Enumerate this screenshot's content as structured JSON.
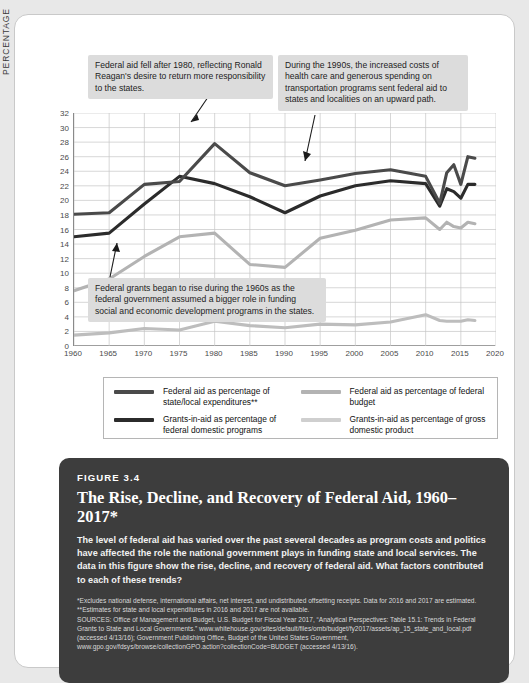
{
  "chart_data": {
    "type": "line",
    "xlabel": "",
    "ylabel": "PERCENTAGE",
    "xlim": [
      1960,
      2020
    ],
    "ylim": [
      0,
      32
    ],
    "ytick_step": 2,
    "yticks": [
      32,
      30,
      28,
      26,
      24,
      22,
      20,
      18,
      16,
      14,
      12,
      10,
      8,
      6,
      4,
      2,
      0
    ],
    "xticks": [
      1960,
      1965,
      1970,
      1975,
      1980,
      1985,
      1990,
      1995,
      2000,
      2005,
      2010,
      2015,
      2020
    ],
    "grid": true,
    "legend_position": "below",
    "x": [
      1960,
      1965,
      1970,
      1975,
      1980,
      1985,
      1990,
      1995,
      2000,
      2005,
      2010,
      2012,
      2013,
      2014,
      2015,
      2016,
      2017
    ],
    "series": [
      {
        "name": "Grants-in-aid as percentage of federal domestic programs",
        "color": "#2b2b2b",
        "values": [
          15.0,
          15.5,
          19.5,
          23.3,
          22.3,
          20.5,
          18.3,
          20.6,
          22.0,
          22.7,
          22.3,
          19.2,
          21.6,
          21.2,
          20.3,
          22.2,
          22.2
        ]
      },
      {
        "name": "Federal aid as percentage of state/local expenditures**",
        "color": "#4a4a4a",
        "values": [
          18.1,
          18.3,
          22.2,
          22.6,
          27.8,
          23.8,
          22.0,
          22.8,
          23.7,
          24.2,
          23.3,
          19.6,
          23.8,
          24.9,
          22.2,
          26.0,
          25.8
        ]
      },
      {
        "name": "Federal aid as percentage of federal budget",
        "color": "#b3b3b3",
        "values": [
          7.6,
          9.2,
          12.3,
          15.0,
          15.5,
          11.2,
          10.8,
          14.8,
          15.9,
          17.3,
          17.6,
          16.0,
          17.0,
          16.4,
          16.2,
          17.0,
          16.8
        ]
      },
      {
        "name": "Grants-in-aid as percentage of gross domestic product",
        "color": "#bdbdbd",
        "values": [
          1.5,
          1.8,
          2.4,
          2.2,
          3.4,
          2.8,
          2.5,
          3.0,
          2.9,
          3.3,
          4.3,
          3.5,
          3.4,
          3.4,
          3.4,
          3.6,
          3.5
        ]
      }
    ],
    "annotations": [
      "Federal aid fell after 1980, reflecting Ronald Reagan's desire to return more responsibility to the states.",
      "During the 1990s, the increased costs of health care and generous spending on transportation programs sent federal aid to states and localities on an upward path.",
      "Federal grants began to rise during the 1960s as the federal government assumed a bigger role in funding social and economic development programs in the states."
    ]
  },
  "callouts": {
    "one": "Federal aid fell after 1980, reflecting Ronald Reagan's desire to return more responsibility to the states.",
    "two": "During the 1990s, the increased costs of health care and generous spending on transportation programs sent federal aid to states and localities on an upward path.",
    "three": "Federal grants began to rise during the 1960s as the federal government assumed a bigger role in funding social and economic development programs in the states."
  },
  "axis": {
    "y_title": "PERCENTAGE",
    "y_labels": [
      "32",
      "30",
      "28",
      "26",
      "24",
      "22",
      "20",
      "18",
      "16",
      "14",
      "12",
      "10",
      "8",
      "6",
      "4",
      "2",
      "0"
    ],
    "x_labels": [
      "1960",
      "1965",
      "1970",
      "1975",
      "1980",
      "1985",
      "1990",
      "1995",
      "2000",
      "2005",
      "2010",
      "2015",
      "2020"
    ]
  },
  "legend": {
    "items": [
      {
        "label": "Federal aid as percentage of state/local expenditures**",
        "color": "#4a4a4a"
      },
      {
        "label": "Federal aid as percentage of federal budget",
        "color": "#b3b3b3"
      },
      {
        "label": "Grants-in-aid as percentage of federal domestic programs",
        "color": "#2b2b2b"
      },
      {
        "label": "Grants-in-aid as percentage of gross domestic product",
        "color": "#cfcfcf"
      }
    ]
  },
  "caption": {
    "figure_number": "FIGURE 3.4",
    "title": "The Rise, Decline, and Recovery of Federal Aid, 1960–2017*",
    "description": "The level of federal aid has varied over the past several decades as program costs and politics have affected the role the national government plays in funding state and local services. The data in this figure show the rise, decline, and recovery of federal aid. What factors contributed to each of these trends?",
    "note_1": "*Excludes national defense, international affairs, net interest, and undistributed offsetting receipts. Data for 2016 and 2017 are estimated.",
    "note_2": "**Estimates for state and local expenditures in 2016 and 2017 are not available.",
    "sources": "SOURCES: Office of Management and Budget, U.S. Budget for Fiscal Year 2017, “Analytical Perspectives: Table 15.1: Trends in Federal Grants to State and Local Governments.” www.whitehouse.gov/sites/default/files/omb/budget/fy2017/assets/ap_15_state_and_local.pdf (accessed 4/13/16); Government Publishing Office, Budget of the United States Government, www.gpo.gov/fdsys/browse/collectionGPO.action?collectionCode=BUDGET (accessed 4/13/16)."
  }
}
